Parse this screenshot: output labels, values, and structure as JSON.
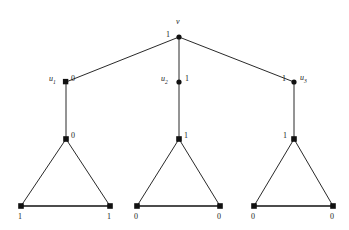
{
  "figure": {
    "type": "graph-diagram",
    "background_color": "#ffffff",
    "line_color": "#111111",
    "node_color": "#111111"
  },
  "nodes": {
    "root": {
      "id": "v",
      "name_label": "v",
      "value_label": "1",
      "shape": "dot",
      "x": 179,
      "y": 37,
      "value_side": "left",
      "name_position": "above"
    },
    "level1": [
      {
        "id": "u1",
        "name_label": "u",
        "name_subscript": "1",
        "value_label": "0",
        "shape": "square",
        "x": 66,
        "y": 82,
        "value_side": "right",
        "name_side": "left"
      },
      {
        "id": "u2",
        "name_label": "u",
        "name_subscript": "2",
        "value_label": "1",
        "shape": "dot",
        "x": 179,
        "y": 82,
        "value_side": "right",
        "name_side": "left"
      },
      {
        "id": "u3",
        "name_label": "u",
        "name_subscript": "3",
        "value_label": "1",
        "shape": "dot",
        "x": 294,
        "y": 82,
        "value_side": "left",
        "name_side": "right"
      }
    ],
    "apexes": [
      {
        "id": "a1",
        "value_label": "0",
        "shape": "square",
        "x": 66,
        "y": 139,
        "value_side": "right"
      },
      {
        "id": "a2",
        "value_label": "1",
        "shape": "square",
        "x": 179,
        "y": 139,
        "value_side": "right"
      },
      {
        "id": "a3",
        "value_label": "1",
        "shape": "square",
        "x": 294,
        "y": 139,
        "value_side": "left"
      }
    ],
    "leaves": [
      {
        "id": "l1",
        "value_label": "1",
        "shape": "square",
        "x": 21,
        "y": 206,
        "value_position": "below"
      },
      {
        "id": "l2",
        "value_label": "1",
        "shape": "square",
        "x": 110,
        "y": 206,
        "value_position": "below"
      },
      {
        "id": "l3",
        "value_label": "0",
        "shape": "square",
        "x": 137,
        "y": 206,
        "value_position": "below"
      },
      {
        "id": "l4",
        "value_label": "0",
        "shape": "square",
        "x": 220,
        "y": 206,
        "value_position": "below"
      },
      {
        "id": "l5",
        "value_label": "0",
        "shape": "square",
        "x": 254,
        "y": 206,
        "value_position": "below"
      },
      {
        "id": "l6",
        "value_label": "0",
        "shape": "square",
        "x": 333,
        "y": 206,
        "value_position": "below"
      }
    ]
  },
  "edges": [
    {
      "from": "v",
      "to": "u1",
      "kind": "thin"
    },
    {
      "from": "v",
      "to": "u2",
      "kind": "thin"
    },
    {
      "from": "v",
      "to": "u3",
      "kind": "thin"
    },
    {
      "from": "u1",
      "to": "a1",
      "kind": "thin"
    },
    {
      "from": "u2",
      "to": "a2",
      "kind": "thin"
    },
    {
      "from": "u3",
      "to": "a3",
      "kind": "thin"
    },
    {
      "from": "a1",
      "to": "l1",
      "kind": "thin"
    },
    {
      "from": "a1",
      "to": "l2",
      "kind": "thin"
    },
    {
      "from": "l1",
      "to": "l2",
      "kind": "base"
    },
    {
      "from": "a2",
      "to": "l3",
      "kind": "thin"
    },
    {
      "from": "a2",
      "to": "l4",
      "kind": "thin"
    },
    {
      "from": "l3",
      "to": "l4",
      "kind": "base"
    },
    {
      "from": "a3",
      "to": "l5",
      "kind": "thin"
    },
    {
      "from": "a3",
      "to": "l6",
      "kind": "thin"
    },
    {
      "from": "l5",
      "to": "l6",
      "kind": "base"
    }
  ]
}
